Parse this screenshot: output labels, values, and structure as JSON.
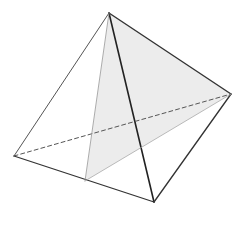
{
  "diagram": {
    "type": "tetrahedron",
    "width": 245,
    "height": 226,
    "background": "#ffffff",
    "vertices": {
      "A": [
        109,
        13
      ],
      "B": [
        14,
        156
      ],
      "C": [
        154,
        202
      ],
      "D": [
        231,
        94
      ],
      "E": [
        85,
        181
      ]
    },
    "shaded_face": {
      "points": [
        "A",
        "E",
        "D"
      ],
      "fill": "#ececec"
    },
    "edges": [
      {
        "from": "A",
        "to": "B",
        "style": "solid",
        "color": "#555555",
        "width": 1
      },
      {
        "from": "A",
        "to": "C",
        "style": "solid",
        "color": "#222222",
        "width": 1.6
      },
      {
        "from": "A",
        "to": "D",
        "style": "solid",
        "color": "#333333",
        "width": 1.4
      },
      {
        "from": "B",
        "to": "C",
        "style": "solid",
        "color": "#333333",
        "width": 1.3
      },
      {
        "from": "C",
        "to": "D",
        "style": "solid",
        "color": "#333333",
        "width": 1.3
      },
      {
        "from": "B",
        "to": "D",
        "style": "dashed",
        "color": "#555555",
        "width": 1
      },
      {
        "from": "A",
        "to": "E",
        "style": "solid",
        "color": "#999999",
        "width": 0.8
      },
      {
        "from": "E",
        "to": "D",
        "style": "solid",
        "color": "#aaaaaa",
        "width": 0.8
      }
    ]
  }
}
